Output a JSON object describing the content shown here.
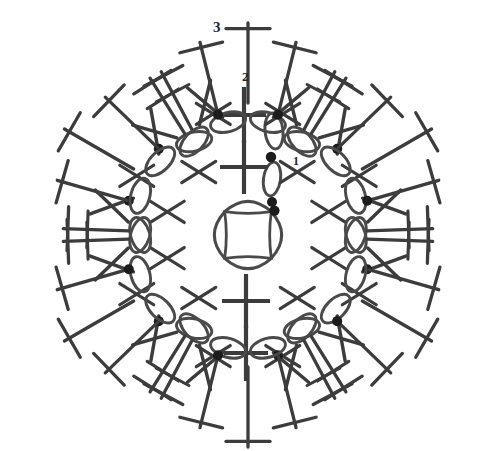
{
  "diagram": {
    "type": "crochet-stitch-chart",
    "background_color": "#ffffff",
    "stroke_color": "#3c3c3c",
    "chain_color": "#4a4a4a",
    "dot_color": "#1c1c1c",
    "label_color": "#262626",
    "canvas": {
      "width": 482,
      "height": 451
    },
    "center": {
      "x": 248,
      "y": 235
    },
    "symmetry": {
      "petals": 6,
      "rotation_offset_deg": -90
    }
  },
  "round_labels": [
    {
      "id": "round-1",
      "text": "1",
      "x": 293,
      "y": 155,
      "font_size": 12
    },
    {
      "id": "round-2",
      "text": "2",
      "x": 242,
      "y": 70,
      "font_size": 13
    },
    {
      "id": "round-3",
      "text": "3",
      "x": 213,
      "y": 20,
      "font_size": 15
    }
  ],
  "legend_symbols": [
    {
      "name": "chain-stitch",
      "glyph": "oval",
      "description": "chain (ch)"
    },
    {
      "name": "slip-stitch",
      "glyph": "dot",
      "description": "slip stitch (sl st)"
    },
    {
      "name": "double-crochet",
      "glyph": "cross",
      "description": "double crochet"
    },
    {
      "name": "treble-crochet",
      "glyph": "t-bar",
      "description": "treble crochet (tr)"
    },
    {
      "name": "x-stitch",
      "glyph": "x",
      "description": "single crochet / X stitch"
    }
  ],
  "rounds": {
    "round_1": {
      "label": "1",
      "description": "Centre ring of 4 chain arcs forming a square ring",
      "ring_radius": 33,
      "chain_arcs": 4
    },
    "round_2": {
      "label": "2",
      "description": "Inner round of X stitches and plus-shaped double crochets around the centre ring",
      "plus_count": 4,
      "x_count": 8,
      "plus_radius": 72,
      "x_radius": 80
    },
    "round_3": {
      "label": "3",
      "description": "Six outer petals, each a fan of treble crochet stitches with chain loops and slip-stitch dots",
      "petal_count": 6,
      "trebles_per_petal": 7,
      "chain_loops_per_arc": 4,
      "dots_per_petal": 2
    }
  },
  "geometry": {
    "petal_angles_deg": [
      -90,
      -30,
      30,
      90,
      150,
      210
    ],
    "chain_arc_radius": 118,
    "fan_inner_radius": 132,
    "fan_outer_radius": 212,
    "dot_radius": 5
  }
}
